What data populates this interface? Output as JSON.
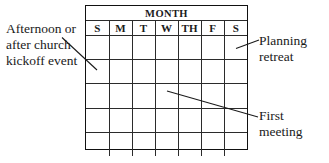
{
  "diagram": {
    "calendar": {
      "month_header": "MONTH",
      "day_headers": [
        "S",
        "M",
        "T",
        "W",
        "TH",
        "F",
        "S"
      ],
      "body_rows": 5,
      "cells_per_row": 7,
      "cell_contents": [
        [
          "",
          "",
          "",
          "",
          "",
          "",
          ""
        ],
        [
          "",
          "",
          "",
          "",
          "",
          "",
          ""
        ],
        [
          "",
          "",
          "",
          "",
          "",
          "",
          ""
        ],
        [
          "",
          "",
          "",
          "",
          "",
          "",
          ""
        ],
        [
          "",
          "",
          "",
          "",
          "",
          "",
          ""
        ]
      ]
    },
    "annotations": {
      "left": "Afternoon or after church kickoff event",
      "planning": "Planning retreat",
      "first_meeting": "First meeting"
    },
    "colors": {
      "background": "#ffffff",
      "text": "#1a1a1a",
      "grid_line": "#2b2b2b",
      "grid_border": "#111111",
      "leader_line": "#1a1a1a"
    }
  }
}
